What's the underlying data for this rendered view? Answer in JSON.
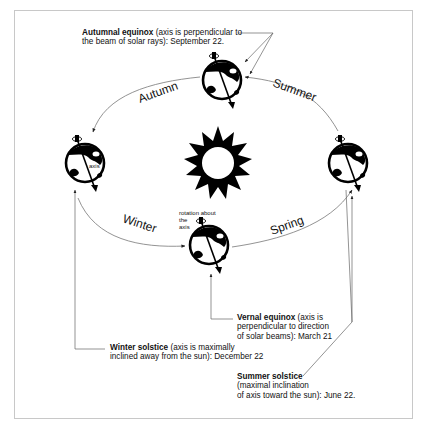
{
  "diagram": {
    "type": "earth-orbit-seasons",
    "center": {
      "label": "Sun",
      "icon": "sun-icon"
    },
    "seasons": [
      {
        "label": "Autumn",
        "arc": "top-left"
      },
      {
        "label": "Summer",
        "arc": "top-right"
      },
      {
        "label": "Winter",
        "arc": "bottom-left"
      },
      {
        "label": "Spring",
        "arc": "bottom-right"
      }
    ],
    "earth_labels": {
      "axis": "axis",
      "rotation_1": "rotation about",
      "rotation_2": "the",
      "rotation_3": "axis"
    },
    "annotations": {
      "autumnal": {
        "title": "Autumnal equinox",
        "text_line1": " (axis is perpendicular to",
        "text_line2": "the beam of solar rays): September 22."
      },
      "vernal": {
        "title": "Vernal equinox",
        "text_line1": " (axis is",
        "text_line2": "perpendicular to direction",
        "text_line3": "of solar beams): March 21"
      },
      "winter": {
        "title": "Winter solstice",
        "text_line1": " (axis is maximally",
        "text_line2": "inclined away from the sun): December 22"
      },
      "summer": {
        "title": "Summer solstice",
        "text_line1": "(maximal inclination",
        "text_line2": "of axis toward the sun): June 22."
      }
    },
    "colors": {
      "ink": "#111111",
      "line": "#555555",
      "frame": "#c8c8c8",
      "background": "#ffffff"
    }
  }
}
